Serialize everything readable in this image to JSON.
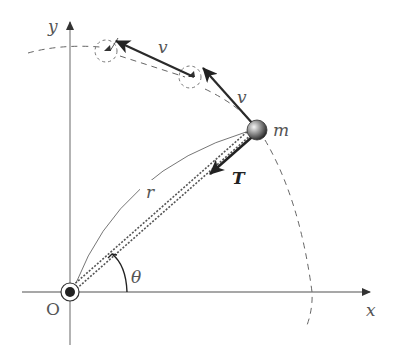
{
  "diagram": {
    "type": "uniform circular motion of a mass on a string",
    "axes": {
      "x_label": "x",
      "y_label": "y",
      "origin_label": "O"
    },
    "labels": {
      "mass": "m",
      "velocity_1": "v",
      "velocity_2": "v",
      "tension": "T",
      "radius": "r",
      "angle": "θ"
    },
    "colors": {
      "axis": "#808080",
      "arrow": "#2a2a2a",
      "dashed_path": "#666666",
      "string": "#555555",
      "mass_fill_light": "#eeeeee",
      "mass_fill_dark": "#333333"
    }
  }
}
